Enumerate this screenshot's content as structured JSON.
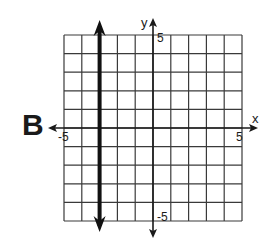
{
  "panel": {
    "label": "B"
  },
  "chart_data": {
    "type": "line",
    "title": "",
    "panel_label": "B",
    "xlabel": "x",
    "ylabel": "y",
    "xlim": [
      -5,
      5
    ],
    "ylim": [
      -5,
      5
    ],
    "grid": true,
    "grid_step": 1,
    "tick_labels": {
      "x_min": "-5",
      "x_max": "5",
      "y_min": "-5",
      "y_max": "5"
    },
    "series": [
      {
        "name": "x = -3",
        "kind": "vertical_line",
        "x": [
          -3,
          -3
        ],
        "y": [
          -5,
          5
        ],
        "arrows_both_ends": true,
        "style": "bold"
      }
    ]
  },
  "colors": {
    "grid": "#3a3a3a",
    "axes": "#1a1a1a",
    "line": "#111111",
    "background": "#ffffff"
  }
}
